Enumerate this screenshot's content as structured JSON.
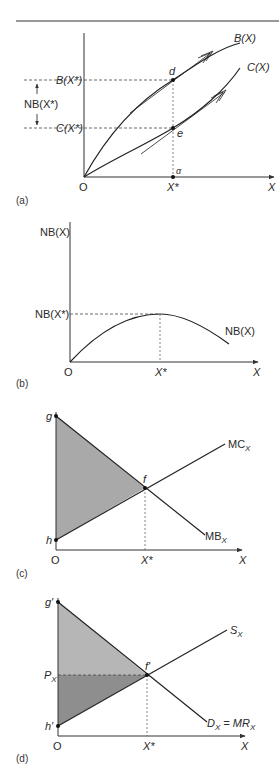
{
  "figure": {
    "rule_color": "#333333",
    "panel_a": {
      "caption": "(a)",
      "origin": "O",
      "x_axis_label": "X",
      "x_star": "X*",
      "alpha": "α",
      "benefit_curve": "B(X)",
      "cost_curve": "C(X)",
      "b_level": "B(X*)",
      "c_level": "C(X*)",
      "nb_bracket": "NB(X*)",
      "point_d": "d",
      "point_e": "e"
    },
    "panel_b": {
      "caption": "(b)",
      "origin": "O",
      "y_axis_label": "NB(X)",
      "x_axis_label": "X",
      "x_star": "X*",
      "peak_level": "NB(X*)",
      "curve_label": "NB(X)"
    },
    "panel_c": {
      "caption": "(c)",
      "origin": "O",
      "x_axis_label": "X",
      "x_star": "X*",
      "point_g": "g",
      "point_h": "h",
      "point_f": "f",
      "mc_label": "MC",
      "mc_sub": "X",
      "mb_label": "MB",
      "mb_sub": "X",
      "shade_color": "#a9a9a9"
    },
    "panel_d": {
      "caption": "(d)",
      "origin": "O",
      "x_axis_label": "X",
      "x_star": "X*",
      "point_g": "g'",
      "point_h": "h'",
      "point_f": "f'",
      "price_label": "P",
      "price_sub": "X",
      "supply_label": "S",
      "supply_sub": "X",
      "demand_label": "D",
      "demand_sub": "X",
      "demand_eq": " = MR",
      "demand_eq_sub": "X",
      "consumer_surplus_color": "#b6b6b6",
      "producer_surplus_color": "#8e8e8e"
    }
  }
}
